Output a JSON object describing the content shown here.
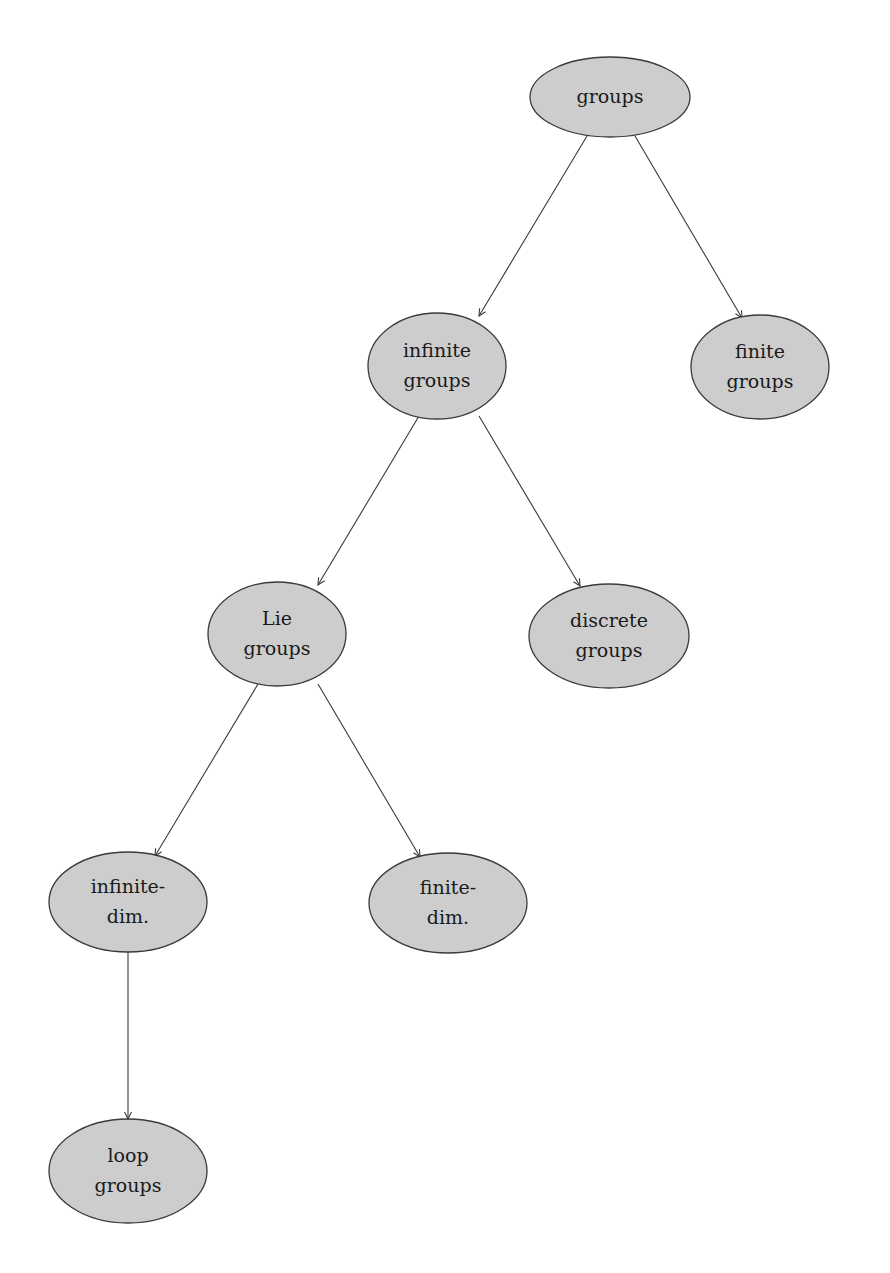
{
  "diagram": {
    "type": "tree",
    "style": {
      "node_fill": "#cdcdcd",
      "node_stroke": "#3a3a3a",
      "edge_color": "#3a3a3a",
      "background": "#ffffff"
    },
    "nodes": [
      {
        "id": "groups",
        "lines": [
          "groups"
        ],
        "cx": 610,
        "cy": 97,
        "rx": 80,
        "ry": 40
      },
      {
        "id": "infinite-groups",
        "lines": [
          "infinite",
          "groups"
        ],
        "cx": 437,
        "cy": 366,
        "rx": 69,
        "ry": 53
      },
      {
        "id": "finite-groups",
        "lines": [
          "finite",
          "groups"
        ],
        "cx": 760,
        "cy": 367,
        "rx": 69,
        "ry": 52
      },
      {
        "id": "lie-groups",
        "lines": [
          "Lie",
          "groups"
        ],
        "cx": 277,
        "cy": 634,
        "rx": 69,
        "ry": 52
      },
      {
        "id": "discrete-groups",
        "lines": [
          "discrete",
          "groups"
        ],
        "cx": 609,
        "cy": 636,
        "rx": 80,
        "ry": 52
      },
      {
        "id": "infinite-dim",
        "lines": [
          "infinite-",
          "dim."
        ],
        "cx": 128,
        "cy": 902,
        "rx": 79,
        "ry": 50
      },
      {
        "id": "finite-dim",
        "lines": [
          "finite-",
          "dim."
        ],
        "cx": 448,
        "cy": 903,
        "rx": 79,
        "ry": 50
      },
      {
        "id": "loop-groups",
        "lines": [
          "loop",
          "groups"
        ],
        "cx": 128,
        "cy": 1171,
        "rx": 79,
        "ry": 52
      }
    ],
    "edges": [
      {
        "from": "groups",
        "to": "infinite-groups",
        "x1": 587,
        "y1": 136,
        "x2": 479,
        "y2": 316
      },
      {
        "from": "groups",
        "to": "finite-groups",
        "x1": 635,
        "y1": 136,
        "x2": 742,
        "y2": 318
      },
      {
        "from": "infinite-groups",
        "to": "lie-groups",
        "x1": 419,
        "y1": 416,
        "x2": 318,
        "y2": 585
      },
      {
        "from": "infinite-groups",
        "to": "discrete-groups",
        "x1": 479,
        "y1": 416,
        "x2": 580,
        "y2": 586
      },
      {
        "from": "lie-groups",
        "to": "infinite-dim",
        "x1": 258,
        "y1": 684,
        "x2": 155,
        "y2": 856
      },
      {
        "from": "lie-groups",
        "to": "finite-dim",
        "x1": 318,
        "y1": 684,
        "x2": 420,
        "y2": 857
      },
      {
        "from": "infinite-dim",
        "to": "loop-groups",
        "x1": 128,
        "y1": 952,
        "x2": 128,
        "y2": 1119
      }
    ]
  }
}
